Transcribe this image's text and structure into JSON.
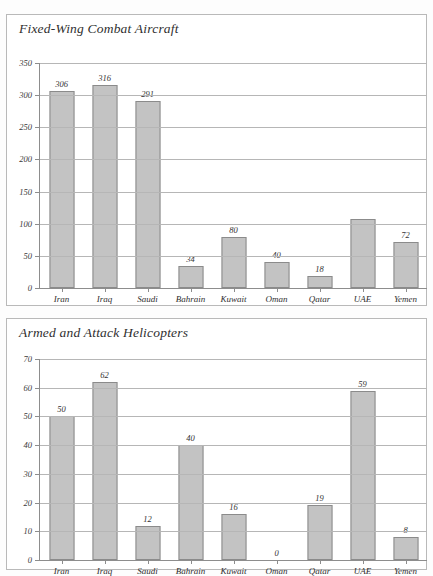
{
  "page": {
    "background_color": "#fdfdfd",
    "frame_border_color": "#b9b9b9"
  },
  "colors": {
    "bar_fill": "#c3c3c3",
    "bar_stroke": "#8b8b8b",
    "gridline": "#b6b6b6",
    "axis": "#8d8d8d",
    "text": "#2b2b2b"
  },
  "charts": [
    {
      "title": "Fixed-Wing Combat Aircraft",
      "ylabels": [
        "350",
        "300",
        "250",
        "200",
        "150",
        "100",
        "50",
        "0"
      ],
      "xlabels": [
        "Iran",
        "Iraq",
        "Saudi",
        "Bahrain",
        "Kuwait",
        "Oman",
        "Qatar",
        "UAE",
        "Yemen"
      ],
      "value_labels": [
        "306",
        "316",
        "291",
        "34",
        "80",
        "40",
        "18",
        "",
        "72"
      ]
    },
    {
      "title": "Armed and Attack Helicopters",
      "ylabels": [
        "70",
        "60",
        "50",
        "40",
        "30",
        "20",
        "10",
        "0"
      ],
      "xlabels": [
        "Iran",
        "Iraq",
        "Saudi",
        "Bahrain",
        "Kuwait",
        "Oman",
        "Qatar",
        "UAE",
        "Yemen"
      ],
      "value_labels": [
        "50",
        "62",
        "12",
        "40",
        "16",
        "0",
        "19",
        "59",
        "8"
      ]
    }
  ],
  "chart_data": [
    {
      "type": "bar",
      "title": "Fixed-Wing Combat Aircraft",
      "categories": [
        "Iran",
        "Iraq",
        "Saudi",
        "Bahrain",
        "Kuwait",
        "Oman",
        "Qatar",
        "UAE",
        "Yemen"
      ],
      "values": [
        306,
        316,
        291,
        34,
        80,
        40,
        18,
        107,
        72
      ],
      "data_labels": [
        "306",
        "316",
        "291",
        "34",
        "80",
        "40",
        "18",
        "",
        "72"
      ],
      "xlabel": "",
      "ylabel": "",
      "ylim": [
        0,
        350
      ],
      "yticks": [
        0,
        50,
        100,
        150,
        200,
        250,
        300,
        350
      ],
      "grid": true,
      "legend": false
    },
    {
      "type": "bar",
      "title": "Armed and Attack Helicopters",
      "categories": [
        "Iran",
        "Iraq",
        "Saudi",
        "Bahrain",
        "Kuwait",
        "Oman",
        "Qatar",
        "UAE",
        "Yemen"
      ],
      "values": [
        50,
        62,
        12,
        40,
        16,
        0,
        19,
        59,
        8
      ],
      "data_labels": [
        "50",
        "62",
        "12",
        "40",
        "16",
        "0",
        "19",
        "59",
        "8"
      ],
      "xlabel": "",
      "ylabel": "",
      "ylim": [
        0,
        70
      ],
      "yticks": [
        0,
        10,
        20,
        30,
        40,
        50,
        60,
        70
      ],
      "grid": true,
      "legend": false
    }
  ]
}
